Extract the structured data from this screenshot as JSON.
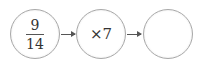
{
  "nodes": [
    {
      "type": "fraction",
      "numerator": "9",
      "denominator": "14"
    },
    {
      "type": "operation",
      "label": "×7"
    },
    {
      "type": "blank",
      "label": ""
    }
  ],
  "arrows": 2
}
